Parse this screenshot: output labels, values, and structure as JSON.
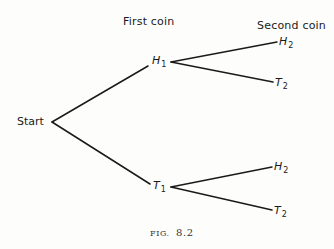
{
  "headers": {
    "first": "First coin",
    "second": "Second coin"
  },
  "root": {
    "label": "Start"
  },
  "level1": [
    {
      "letter": "H",
      "sub": "1"
    },
    {
      "letter": "T",
      "sub": "1"
    }
  ],
  "level2": [
    {
      "letter": "H",
      "sub": "2",
      "parent": "H1"
    },
    {
      "letter": "T",
      "sub": "2",
      "parent": "H1"
    },
    {
      "letter": "H",
      "sub": "2",
      "parent": "T1"
    },
    {
      "letter": "T",
      "sub": "2",
      "parent": "T1"
    }
  ],
  "caption": {
    "prefix": "FIG.",
    "number": "8.2"
  },
  "colors": {
    "ink": "#1a1a1a",
    "paper": "#fdfdfc"
  }
}
